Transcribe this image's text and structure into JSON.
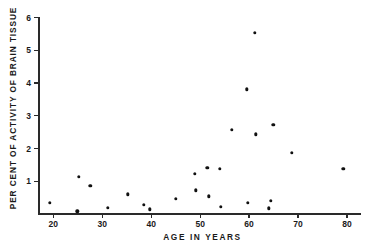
{
  "chart_data": {
    "type": "scatter",
    "title": "",
    "xlabel": "AGE IN YEARS",
    "ylabel": "PER CENT OF ACTIVITY OF BRAIN TISSUE",
    "xlim": [
      17,
      83
    ],
    "ylim": [
      0,
      6
    ],
    "xticks": [
      20,
      30,
      40,
      50,
      60,
      70,
      80
    ],
    "xtick_labels": [
      "20",
      "30",
      "40",
      "50",
      "60",
      "70",
      "80"
    ],
    "yticks": [
      1,
      2,
      3,
      4,
      5,
      6
    ],
    "ytick_labels": [
      "1",
      "2",
      "3",
      "4",
      "5",
      "6"
    ],
    "grid": false,
    "legend": null,
    "marker": "filled-circle",
    "marker_color": "#111111",
    "axis_color": "#2a2a2a",
    "background": "#ffffff",
    "points": [
      {
        "x": 19.4,
        "y": 0.33
      },
      {
        "x": 25.0,
        "y": 0.06
      },
      {
        "x": 25.4,
        "y": 1.12
      },
      {
        "x": 27.7,
        "y": 0.85
      },
      {
        "x": 31.3,
        "y": 0.18
      },
      {
        "x": 35.3,
        "y": 0.58
      },
      {
        "x": 38.6,
        "y": 0.27
      },
      {
        "x": 39.9,
        "y": 0.12
      },
      {
        "x": 45.2,
        "y": 0.45
      },
      {
        "x": 49.0,
        "y": 1.21
      },
      {
        "x": 49.3,
        "y": 0.7
      },
      {
        "x": 51.6,
        "y": 1.39
      },
      {
        "x": 51.9,
        "y": 0.52
      },
      {
        "x": 54.2,
        "y": 1.36
      },
      {
        "x": 54.4,
        "y": 0.21
      },
      {
        "x": 56.6,
        "y": 2.55
      },
      {
        "x": 59.7,
        "y": 3.79
      },
      {
        "x": 59.9,
        "y": 0.33
      },
      {
        "x": 61.3,
        "y": 5.52
      },
      {
        "x": 61.5,
        "y": 2.42
      },
      {
        "x": 64.2,
        "y": 0.15
      },
      {
        "x": 64.6,
        "y": 0.39
      },
      {
        "x": 65.1,
        "y": 2.7
      },
      {
        "x": 68.8,
        "y": 1.85
      },
      {
        "x": 79.4,
        "y": 1.36
      }
    ]
  }
}
